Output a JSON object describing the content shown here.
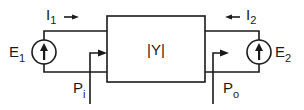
{
  "diagram": {
    "type": "two-port network",
    "block": {
      "label": "|Y|"
    },
    "left_port": {
      "current": {
        "symbol": "I",
        "subscript": "1",
        "direction": "right"
      },
      "source": {
        "symbol": "E",
        "subscript": "1"
      },
      "power": {
        "symbol": "P",
        "subscript": "i"
      }
    },
    "right_port": {
      "current": {
        "symbol": "I",
        "subscript": "2",
        "direction": "left"
      },
      "source": {
        "symbol": "E",
        "subscript": "2"
      },
      "power": {
        "symbol": "P",
        "subscript": "o"
      }
    },
    "colors": {
      "line": "#1a1a1a",
      "background": "#ffffff"
    }
  }
}
